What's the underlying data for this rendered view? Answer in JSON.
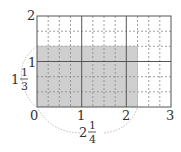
{
  "diagram": {
    "grid": {
      "x_units": 3,
      "y_units": 2,
      "x_subdivisions_per_unit": 4,
      "y_subdivisions_per_unit": 3,
      "origin_px": [
        37,
        107
      ],
      "unit_px": [
        44.67,
        45.5
      ]
    },
    "shaded_region": {
      "width_units": 2.25,
      "height_units": 1.3333,
      "color": "#cfcfcf"
    },
    "colors": {
      "solid_line": "#555555",
      "dashed_line": "#888888",
      "brace": "#aaaaaa",
      "text": "#333333"
    },
    "labels": {
      "x_ticks": [
        "0",
        "1",
        "2",
        "3"
      ],
      "y_ticks": [
        "1",
        "2"
      ],
      "width_whole": "2",
      "width_num": "1",
      "width_den": "4",
      "height_whole": "1",
      "height_num": "1",
      "height_den": "3"
    }
  }
}
